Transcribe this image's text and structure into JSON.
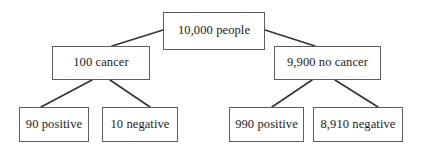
{
  "diagram": {
    "type": "tree",
    "stroke_color": "#5d5d5d",
    "text_color": "#1c1c1c",
    "background_color": "#ffffff",
    "nodes": {
      "root": {
        "label": "10,000 people",
        "count": 10000
      },
      "cancer": {
        "label": "100 cancer",
        "count": 100
      },
      "no_cancer": {
        "label": "9,900 no cancer",
        "count": 9900
      },
      "cancer_positive": {
        "label": "90 positive",
        "count": 90
      },
      "cancer_negative": {
        "label": "10 negative",
        "count": 10
      },
      "no_cancer_positive": {
        "label": "990 positive",
        "count": 990
      },
      "no_cancer_negative": {
        "label": "8,910 negative",
        "count": 8910
      }
    },
    "edges": [
      {
        "from": "root",
        "to": "cancer"
      },
      {
        "from": "root",
        "to": "no_cancer"
      },
      {
        "from": "cancer",
        "to": "cancer_positive"
      },
      {
        "from": "cancer",
        "to": "cancer_negative"
      },
      {
        "from": "no_cancer",
        "to": "no_cancer_positive"
      },
      {
        "from": "no_cancer",
        "to": "no_cancer_negative"
      }
    ]
  }
}
